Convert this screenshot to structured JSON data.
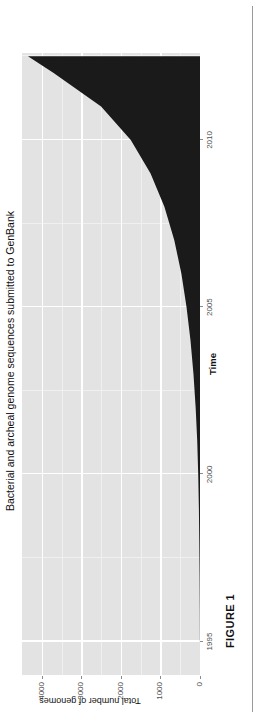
{
  "figure": {
    "caption": "FIGURE 1"
  },
  "chart_data": {
    "type": "area",
    "title": "Bacterial and archeal genome sequences submitted to GenBank",
    "xlabel": "Time",
    "ylabel": "Total number of genomes",
    "xlim": [
      1994,
      2012.6
    ],
    "ylim": [
      0,
      4500
    ],
    "grid": true,
    "legend": null,
    "fill_color": "#1a1a1a",
    "panel_color": "#e3e3e3",
    "gridline_color": "#ffffff",
    "x_ticks": [
      {
        "value": 1995,
        "label": "1995"
      },
      {
        "value": 2000,
        "label": "2000"
      },
      {
        "value": 2005,
        "label": "2005"
      },
      {
        "value": 2010,
        "label": "2010"
      }
    ],
    "y_ticks": [
      {
        "value": 0,
        "label": "0"
      },
      {
        "value": 1000,
        "label": "1000"
      },
      {
        "value": 2000,
        "label": "2000"
      },
      {
        "value": 3000,
        "label": "3000"
      },
      {
        "value": 4000,
        "label": "4000"
      }
    ],
    "x_minor_ticks": [
      1997.5,
      2002.5,
      2007.5,
      2012.5
    ],
    "y_minor_ticks": [
      500,
      1500,
      2500,
      3500
    ],
    "x": [
      1995,
      1996,
      1997,
      1998,
      1999,
      2000,
      2001,
      2002,
      2003,
      2004,
      2005,
      2006,
      2007,
      2008,
      2009,
      2010,
      2011,
      2012,
      2012.5
    ],
    "values": [
      2,
      5,
      10,
      18,
      28,
      45,
      70,
      110,
      165,
      240,
      340,
      470,
      650,
      900,
      1250,
      1750,
      2500,
      3700,
      4350
    ],
    "series": [
      {
        "name": "Total number of genomes",
        "values": [
          2,
          5,
          10,
          18,
          28,
          45,
          70,
          110,
          165,
          240,
          340,
          470,
          650,
          900,
          1250,
          1750,
          2500,
          3700,
          4350
        ]
      }
    ]
  }
}
